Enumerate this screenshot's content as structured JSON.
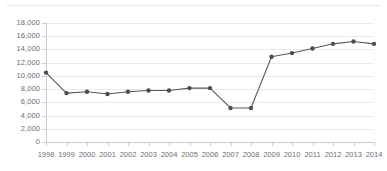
{
  "chart_data": {
    "type": "line",
    "title": "",
    "subtitle": "",
    "xlabel": "",
    "ylabel": "",
    "categories": [
      "1998",
      "1999",
      "2000",
      "2001",
      "2002",
      "2003",
      "2004",
      "2005",
      "2006",
      "2007",
      "2008",
      "2009",
      "2010",
      "2011",
      "2012",
      "2013",
      "2014"
    ],
    "x": [
      1998,
      1999,
      2000,
      2001,
      2002,
      2003,
      2004,
      2005,
      2006,
      2007,
      2008,
      2009,
      2010,
      2011,
      2012,
      2013,
      2014
    ],
    "values": [
      10500,
      7400,
      7600,
      7250,
      7600,
      7800,
      7800,
      8150,
      8150,
      5150,
      5150,
      12900,
      13450,
      14150,
      14850,
      15200,
      14850
    ],
    "series": [
      {
        "name": "series-1",
        "values": [
          10500,
          7400,
          7600,
          7250,
          7600,
          7800,
          7800,
          8150,
          8150,
          5150,
          5150,
          12900,
          13450,
          14150,
          14850,
          15200,
          14850
        ]
      }
    ],
    "ylim": [
      0,
      18000
    ],
    "ytick_values": [
      0,
      2000,
      4000,
      6000,
      8000,
      10000,
      12000,
      14000,
      16000,
      18000
    ],
    "ytick_labels": [
      "0",
      "2,000",
      "4,000",
      "6,000",
      "8,000",
      "10,000",
      "12,000",
      "14,000",
      "16,000",
      "18,000"
    ],
    "xtick_labels": [
      "1998",
      "1999",
      "2000",
      "2001",
      "2002",
      "2003",
      "2004",
      "2005",
      "2006",
      "2007",
      "2008",
      "2009",
      "2010",
      "2011",
      "2012",
      "2013",
      "2014"
    ],
    "grid": true,
    "legend": false,
    "legend_position": "none",
    "annotations": []
  },
  "style": {
    "line_color": "#595959",
    "marker_color": "#4d4d4d",
    "grid_color": "#e9eaec",
    "axis_color": "#c9ccd0",
    "tick_text_color": "#6b7075",
    "background": "#ffffff",
    "divider_color": "#e6e8ea"
  }
}
